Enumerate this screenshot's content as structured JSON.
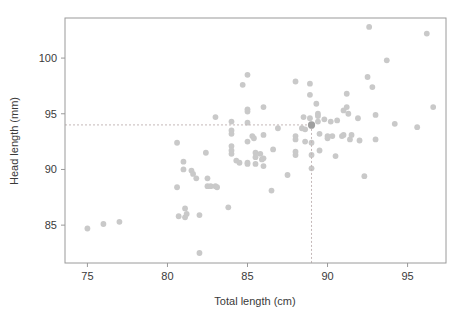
{
  "chart_data": {
    "type": "scatter",
    "title": "",
    "xlabel": "Total length (cm)",
    "ylabel": "Head length (mm)",
    "xlim": [
      73.6,
      97.4
    ],
    "ylim": [
      81.6,
      103.6
    ],
    "xticks": [
      75,
      80,
      85,
      90,
      95
    ],
    "xtick_labels": [
      "75",
      "80",
      "85",
      "90",
      "95"
    ],
    "yticks": [
      85,
      90,
      95,
      100
    ],
    "ytick_labels": [
      "85",
      "90",
      "95",
      "100"
    ],
    "grid": false,
    "legend": "none",
    "marker_color": "#c9c9c9",
    "highlight_color": "#9f9f9f",
    "frame_color": "#9a9a9a",
    "reference_line_color": "#c4b8b8",
    "annotations": [
      {
        "name": "horizontal-reference-line",
        "axis": "y",
        "value": 94.0,
        "style": "dashed"
      },
      {
        "name": "vertical-reference-line",
        "axis": "x",
        "value": 89.0,
        "style": "dashed"
      },
      {
        "name": "highlighted-point",
        "x": 89.0,
        "y": 94.0
      }
    ],
    "points": [
      [
        75.0,
        84.7
      ],
      [
        76.0,
        85.1
      ],
      [
        77.0,
        85.3
      ],
      [
        80.6,
        92.4
      ],
      [
        80.6,
        88.4
      ],
      [
        80.7,
        85.8
      ],
      [
        81.0,
        90.7
      ],
      [
        81.0,
        90.0
      ],
      [
        81.1,
        86.5
      ],
      [
        81.1,
        85.7
      ],
      [
        81.2,
        86.0
      ],
      [
        81.5,
        89.9
      ],
      [
        81.6,
        89.6
      ],
      [
        81.8,
        89.2
      ],
      [
        82.0,
        82.5
      ],
      [
        82.0,
        85.9
      ],
      [
        82.4,
        91.5
      ],
      [
        82.5,
        89.2
      ],
      [
        82.5,
        88.5
      ],
      [
        82.7,
        88.5
      ],
      [
        83.0,
        94.7
      ],
      [
        83.0,
        88.5
      ],
      [
        83.1,
        88.4
      ],
      [
        83.8,
        86.6
      ],
      [
        84.0,
        94.3
      ],
      [
        84.0,
        93.5
      ],
      [
        84.0,
        93.2
      ],
      [
        84.0,
        92.1
      ],
      [
        84.0,
        91.7
      ],
      [
        84.0,
        91.4
      ],
      [
        84.3,
        90.8
      ],
      [
        84.5,
        90.6
      ],
      [
        85.0,
        98.5
      ],
      [
        85.0,
        95.4
      ],
      [
        85.0,
        95.2
      ],
      [
        85.0,
        94.2
      ],
      [
        85.0,
        92.5
      ],
      [
        85.0,
        90.6
      ],
      [
        85.0,
        90.5
      ],
      [
        84.7,
        97.6
      ],
      [
        85.3,
        93.0
      ],
      [
        85.4,
        92.8
      ],
      [
        85.5,
        91.5
      ],
      [
        85.5,
        91.1
      ],
      [
        85.5,
        90.5
      ],
      [
        85.8,
        91.4
      ],
      [
        85.9,
        90.9
      ],
      [
        86.0,
        95.6
      ],
      [
        86.0,
        93.1
      ],
      [
        86.0,
        90.3
      ],
      [
        86.0,
        91.0
      ],
      [
        86.5,
        88.1
      ],
      [
        86.6,
        91.8
      ],
      [
        86.9,
        93.7
      ],
      [
        87.5,
        89.5
      ],
      [
        88.0,
        97.9
      ],
      [
        88.0,
        93.0
      ],
      [
        88.0,
        92.7
      ],
      [
        88.0,
        91.6
      ],
      [
        88.0,
        91.3
      ],
      [
        88.4,
        93.7
      ],
      [
        88.5,
        94.7
      ],
      [
        88.6,
        93.6
      ],
      [
        88.6,
        92.5
      ],
      [
        88.9,
        97.7
      ],
      [
        88.9,
        96.7
      ],
      [
        88.9,
        94.6
      ],
      [
        89.0,
        93.9
      ],
      [
        89.0,
        92.4
      ],
      [
        89.0,
        91.3
      ],
      [
        89.0,
        90.1
      ],
      [
        89.3,
        95.9
      ],
      [
        89.4,
        95.0
      ],
      [
        89.4,
        94.8
      ],
      [
        89.4,
        94.3
      ],
      [
        89.5,
        93.2
      ],
      [
        89.5,
        91.7
      ],
      [
        89.8,
        94.5
      ],
      [
        90.0,
        93.0
      ],
      [
        90.0,
        92.8
      ],
      [
        90.2,
        94.3
      ],
      [
        90.3,
        93.0
      ],
      [
        90.5,
        91.2
      ],
      [
        90.6,
        94.4
      ],
      [
        90.9,
        93.0
      ],
      [
        91.0,
        95.3
      ],
      [
        91.0,
        93.1
      ],
      [
        91.2,
        96.8
      ],
      [
        91.2,
        95.6
      ],
      [
        91.3,
        95.0
      ],
      [
        91.4,
        92.7
      ],
      [
        91.5,
        93.1
      ],
      [
        91.9,
        94.6
      ],
      [
        92.0,
        92.6
      ],
      [
        92.3,
        89.4
      ],
      [
        92.5,
        98.3
      ],
      [
        92.6,
        102.8
      ],
      [
        92.8,
        97.4
      ],
      [
        93.0,
        94.9
      ],
      [
        93.0,
        92.7
      ],
      [
        93.7,
        99.8
      ],
      [
        94.2,
        94.1
      ],
      [
        95.6,
        93.8
      ],
      [
        96.2,
        102.2
      ],
      [
        96.6,
        95.6
      ]
    ]
  }
}
